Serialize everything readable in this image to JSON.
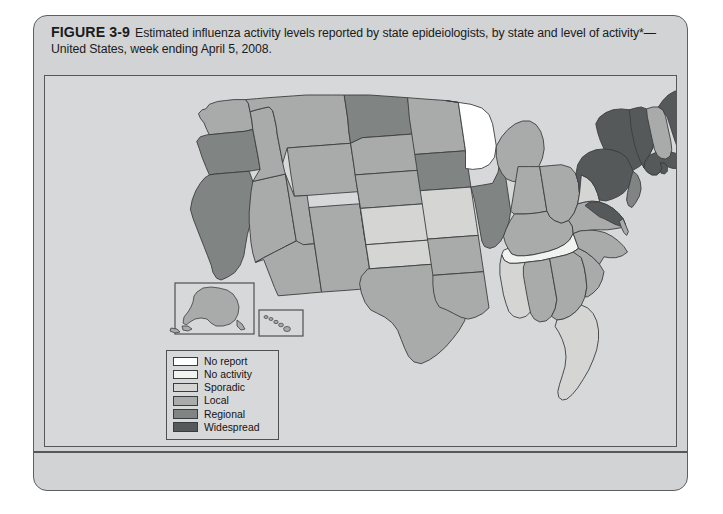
{
  "figure": {
    "number": "FIGURE 3-9",
    "caption": "Estimated influenza activity levels reported by state epideiologists, by state and level of activity*—United States, week ending April 5, 2008."
  },
  "legend": {
    "title": "Activity level",
    "items": [
      {
        "label": "No report",
        "color": "#ffffff",
        "key": "no-report"
      },
      {
        "label": "No activity",
        "color": "#f2f2f1",
        "key": "no-activity"
      },
      {
        "label": "Sporadic",
        "color": "#d5d6d4",
        "key": "sporadic"
      },
      {
        "label": "Local",
        "color": "#a9abaa",
        "key": "local"
      },
      {
        "label": "Regional",
        "color": "#808483",
        "key": "regional"
      },
      {
        "label": "Widespread",
        "color": "#56595a",
        "key": "widespread"
      }
    ]
  },
  "map": {
    "name": "united-states-influenza-activity-map",
    "insets": [
      "alaska-inset",
      "hawaii-inset"
    ],
    "states": [
      {
        "code": "WA",
        "name": "Washington",
        "level": "local"
      },
      {
        "code": "OR",
        "name": "Oregon",
        "level": "regional"
      },
      {
        "code": "CA",
        "name": "California",
        "level": "regional"
      },
      {
        "code": "NV",
        "name": "Nevada",
        "level": "local"
      },
      {
        "code": "ID",
        "name": "Idaho",
        "level": "local"
      },
      {
        "code": "MT",
        "name": "Montana",
        "level": "local"
      },
      {
        "code": "WY",
        "name": "Wyoming",
        "level": "local"
      },
      {
        "code": "UT",
        "name": "Utah",
        "level": "local"
      },
      {
        "code": "AZ",
        "name": "Arizona",
        "level": "local"
      },
      {
        "code": "NM",
        "name": "New Mexico",
        "level": "local"
      },
      {
        "code": "CO",
        "name": "Colorado",
        "level": "regional"
      },
      {
        "code": "ND",
        "name": "North Dakota",
        "level": "regional"
      },
      {
        "code": "SD",
        "name": "South Dakota",
        "level": "local"
      },
      {
        "code": "NE",
        "name": "Nebraska",
        "level": "local"
      },
      {
        "code": "KS",
        "name": "Kansas",
        "level": "sporadic"
      },
      {
        "code": "OK",
        "name": "Oklahoma",
        "level": "sporadic"
      },
      {
        "code": "TX",
        "name": "Texas",
        "level": "local"
      },
      {
        "code": "MN",
        "name": "Minnesota",
        "level": "local"
      },
      {
        "code": "IA",
        "name": "Iowa",
        "level": "regional"
      },
      {
        "code": "MO",
        "name": "Missouri",
        "level": "sporadic"
      },
      {
        "code": "AR",
        "name": "Arkansas",
        "level": "local"
      },
      {
        "code": "LA",
        "name": "Louisiana",
        "level": "local"
      },
      {
        "code": "WI",
        "name": "Wisconsin",
        "level": "no-report"
      },
      {
        "code": "IL",
        "name": "Illinois",
        "level": "regional"
      },
      {
        "code": "MI",
        "name": "Michigan",
        "level": "local"
      },
      {
        "code": "IN",
        "name": "Indiana",
        "level": "local"
      },
      {
        "code": "OH",
        "name": "Ohio",
        "level": "local"
      },
      {
        "code": "KY",
        "name": "Kentucky",
        "level": "local"
      },
      {
        "code": "TN",
        "name": "Tennessee",
        "level": "no-activity"
      },
      {
        "code": "MS",
        "name": "Mississippi",
        "level": "sporadic"
      },
      {
        "code": "AL",
        "name": "Alabama",
        "level": "local"
      },
      {
        "code": "GA",
        "name": "Georgia",
        "level": "local"
      },
      {
        "code": "FL",
        "name": "Florida",
        "level": "sporadic"
      },
      {
        "code": "SC",
        "name": "South Carolina",
        "level": "local"
      },
      {
        "code": "NC",
        "name": "North Carolina",
        "level": "local"
      },
      {
        "code": "VA",
        "name": "Virginia",
        "level": "local"
      },
      {
        "code": "WV",
        "name": "West Virginia",
        "level": "sporadic"
      },
      {
        "code": "MD",
        "name": "Maryland",
        "level": "widespread"
      },
      {
        "code": "DE",
        "name": "Delaware",
        "level": "local"
      },
      {
        "code": "PA",
        "name": "Pennsylvania",
        "level": "widespread"
      },
      {
        "code": "NJ",
        "name": "New Jersey",
        "level": "regional"
      },
      {
        "code": "NY",
        "name": "New York",
        "level": "widespread"
      },
      {
        "code": "CT",
        "name": "Connecticut",
        "level": "regional"
      },
      {
        "code": "RI",
        "name": "Rhode Island",
        "level": "widespread"
      },
      {
        "code": "MA",
        "name": "Massachusetts",
        "level": "widespread"
      },
      {
        "code": "VT",
        "name": "Vermont",
        "level": "widespread"
      },
      {
        "code": "NH",
        "name": "New Hampshire",
        "level": "local"
      },
      {
        "code": "ME",
        "name": "Maine",
        "level": "widespread"
      },
      {
        "code": "AK",
        "name": "Alaska",
        "level": "local"
      },
      {
        "code": "HI",
        "name": "Hawaii",
        "level": "local"
      }
    ]
  },
  "chart_data": {
    "type": "map",
    "title": "Estimated influenza activity levels reported by state epideiologists, by state and level of activity*—United States, week ending April 5, 2008.",
    "legend_position": "inside-lower-left",
    "categories": [
      "No report",
      "No activity",
      "Sporadic",
      "Local",
      "Regional",
      "Widespread"
    ],
    "values": {
      "No report": 1,
      "No activity": 1,
      "Sporadic": 6,
      "Local": 25,
      "Regional": 7,
      "Widespread": 7
    }
  }
}
